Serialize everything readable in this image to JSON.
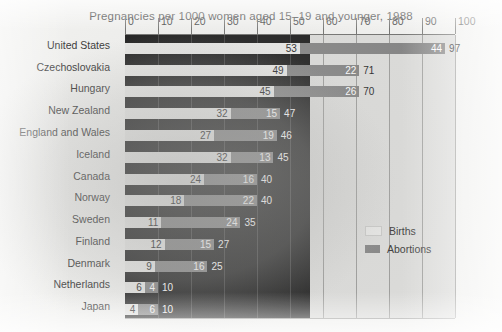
{
  "chart_data": {
    "type": "bar",
    "title": "Pregnancies per 1000 women aged 15–19 and younger, 1988",
    "xlabel": "",
    "ylabel": "",
    "xlim": [
      0,
      100
    ],
    "xticks": [
      0,
      10,
      20,
      30,
      40,
      50,
      60,
      70,
      80,
      90,
      100
    ],
    "grid": true,
    "legend_position": "right-middle",
    "orientation": "horizontal",
    "stacked": true,
    "categories": [
      "United States",
      "Czechoslovakia",
      "Hungary",
      "New Zealand",
      "England and Wales",
      "Iceland",
      "Canada",
      "Norway",
      "Sweden",
      "Finland",
      "Denmark",
      "Netherlands",
      "Japan"
    ],
    "series": [
      {
        "name": "Births",
        "color": "#e8e8e6",
        "values": [
          53,
          49,
          45,
          32,
          27,
          32,
          24,
          18,
          11,
          12,
          9,
          6,
          4
        ]
      },
      {
        "name": "Abortions",
        "color": "#808080",
        "values": [
          44,
          22,
          26,
          15,
          19,
          13,
          16,
          22,
          24,
          15,
          16,
          4,
          6
        ]
      }
    ],
    "totals": [
      97,
      71,
      70,
      47,
      46,
      45,
      40,
      40,
      35,
      27,
      25,
      10,
      10
    ]
  },
  "legend": {
    "items": [
      {
        "label": "Births"
      },
      {
        "label": "Abortions"
      }
    ]
  }
}
